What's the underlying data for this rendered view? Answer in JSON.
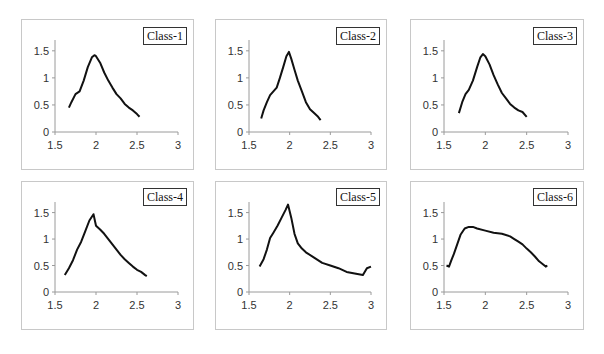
{
  "figure": {
    "panels": [
      {
        "label": "Class-1"
      },
      {
        "label": "Class-2"
      },
      {
        "label": "Class-3"
      },
      {
        "label": "Class-4"
      },
      {
        "label": "Class-5"
      },
      {
        "label": "Class-6"
      }
    ]
  },
  "chart_data": [
    {
      "type": "line",
      "title": "Class-1",
      "legend": [
        "Class-1"
      ],
      "xlim": [
        1.5,
        3
      ],
      "ylim": [
        0,
        1.5
      ],
      "xticks": [
        "1.5",
        "2",
        "2.5",
        "3"
      ],
      "yticks": [
        "0",
        "0.5",
        "1",
        "1.5"
      ],
      "grid": false,
      "x": [
        1.67,
        1.7,
        1.75,
        1.8,
        1.85,
        1.9,
        1.95,
        1.98,
        2.0,
        2.05,
        2.1,
        2.15,
        2.2,
        2.25,
        2.3,
        2.35,
        2.4,
        2.45,
        2.5,
        2.53
      ],
      "y": [
        0.45,
        0.55,
        0.7,
        0.75,
        0.95,
        1.2,
        1.38,
        1.42,
        1.4,
        1.28,
        1.1,
        0.95,
        0.82,
        0.7,
        0.62,
        0.52,
        0.45,
        0.4,
        0.33,
        0.28
      ]
    },
    {
      "type": "line",
      "title": "Class-2",
      "legend": [
        "Class-2"
      ],
      "xlim": [
        1.5,
        3
      ],
      "ylim": [
        0,
        1.5
      ],
      "xticks": [
        "1.5",
        "2",
        "2.5",
        "3"
      ],
      "yticks": [
        "0",
        "0.5",
        "1",
        "1.5"
      ],
      "grid": false,
      "x": [
        1.65,
        1.68,
        1.72,
        1.76,
        1.8,
        1.84,
        1.88,
        1.92,
        1.96,
        1.99,
        2.02,
        2.06,
        2.1,
        2.15,
        2.2,
        2.25,
        2.3,
        2.35,
        2.38
      ],
      "y": [
        0.25,
        0.4,
        0.55,
        0.68,
        0.75,
        0.82,
        1.0,
        1.2,
        1.4,
        1.48,
        1.35,
        1.15,
        0.95,
        0.75,
        0.55,
        0.42,
        0.35,
        0.28,
        0.22
      ]
    },
    {
      "type": "line",
      "title": "Class-3",
      "legend": [
        "Class-3"
      ],
      "xlim": [
        1.5,
        3
      ],
      "ylim": [
        0,
        1.5
      ],
      "xticks": [
        "1.5",
        "2",
        "2.5",
        "3"
      ],
      "yticks": [
        "0",
        "0.5",
        "1",
        "1.5"
      ],
      "grid": false,
      "x": [
        1.68,
        1.72,
        1.76,
        1.8,
        1.85,
        1.9,
        1.94,
        1.97,
        2.0,
        2.05,
        2.1,
        2.15,
        2.2,
        2.25,
        2.3,
        2.35,
        2.4,
        2.45,
        2.5
      ],
      "y": [
        0.35,
        0.55,
        0.7,
        0.78,
        0.95,
        1.2,
        1.38,
        1.44,
        1.4,
        1.25,
        1.05,
        0.88,
        0.72,
        0.62,
        0.52,
        0.45,
        0.4,
        0.37,
        0.28
      ]
    },
    {
      "type": "line",
      "title": "Class-4",
      "legend": [
        "Class-4"
      ],
      "xlim": [
        1.5,
        3
      ],
      "ylim": [
        0,
        1.5
      ],
      "xticks": [
        "1.5",
        "2",
        "2.5",
        "3"
      ],
      "yticks": [
        "0",
        "0.5",
        "1",
        "1.5"
      ],
      "grid": false,
      "x": [
        1.62,
        1.67,
        1.72,
        1.77,
        1.82,
        1.87,
        1.92,
        1.97,
        2.0,
        2.05,
        2.1,
        2.15,
        2.2,
        2.25,
        2.3,
        2.35,
        2.4,
        2.45,
        2.5,
        2.55,
        2.6,
        2.62
      ],
      "y": [
        0.32,
        0.45,
        0.6,
        0.8,
        0.95,
        1.15,
        1.35,
        1.47,
        1.25,
        1.18,
        1.1,
        1.0,
        0.9,
        0.8,
        0.7,
        0.62,
        0.55,
        0.48,
        0.42,
        0.38,
        0.32,
        0.3
      ]
    },
    {
      "type": "line",
      "title": "Class-5",
      "legend": [
        "Class-5"
      ],
      "xlim": [
        1.5,
        3
      ],
      "ylim": [
        0,
        1.5
      ],
      "xticks": [
        "1.5",
        "2",
        "2.5",
        "3"
      ],
      "yticks": [
        "0",
        "0.5",
        "1",
        "1.5"
      ],
      "grid": false,
      "x": [
        1.63,
        1.68,
        1.72,
        1.76,
        1.8,
        1.85,
        1.9,
        1.95,
        1.98,
        2.02,
        2.06,
        2.1,
        2.15,
        2.2,
        2.3,
        2.4,
        2.5,
        2.6,
        2.7,
        2.8,
        2.9,
        2.95,
        3.0
      ],
      "y": [
        0.48,
        0.62,
        0.8,
        1.02,
        1.12,
        1.25,
        1.4,
        1.55,
        1.65,
        1.4,
        1.1,
        0.92,
        0.82,
        0.75,
        0.65,
        0.55,
        0.5,
        0.45,
        0.38,
        0.35,
        0.32,
        0.45,
        0.48
      ]
    },
    {
      "type": "line",
      "title": "Class-6",
      "legend": [
        "Class-6"
      ],
      "xlim": [
        1.5,
        3
      ],
      "ylim": [
        0,
        1.5
      ],
      "xticks": [
        "1.5",
        "2",
        "2.5",
        "3"
      ],
      "yticks": [
        "0",
        "0.5",
        "1",
        "1.5"
      ],
      "grid": false,
      "x": [
        1.53,
        1.56,
        1.59,
        1.62,
        1.66,
        1.7,
        1.75,
        1.8,
        1.85,
        1.9,
        2.0,
        2.1,
        2.2,
        2.3,
        2.35,
        2.4,
        2.45,
        2.5,
        2.55,
        2.6,
        2.65,
        2.7,
        2.73,
        2.75
      ],
      "y": [
        0.5,
        0.48,
        0.6,
        0.72,
        0.9,
        1.08,
        1.2,
        1.23,
        1.23,
        1.2,
        1.16,
        1.12,
        1.1,
        1.05,
        1.0,
        0.95,
        0.9,
        0.82,
        0.75,
        0.67,
        0.58,
        0.52,
        0.48,
        0.5
      ]
    }
  ]
}
